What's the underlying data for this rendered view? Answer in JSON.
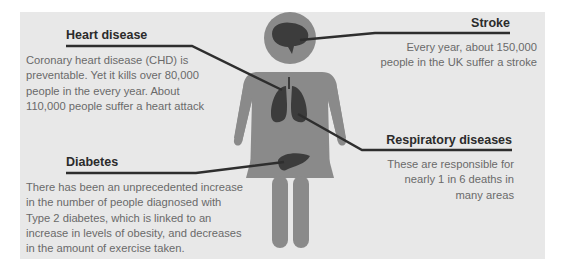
{
  "colors": {
    "panel": "#e8e8e8",
    "figure": "#8a8a8a",
    "organ": "#3c3c3c",
    "leader": "#2e2e2e",
    "title_text": "#2b2b2b",
    "body_text": "#6a6a6a"
  },
  "callouts": {
    "heart": {
      "title": "Heart disease",
      "lines": [
        "Coronary heart disease  (CHD) is",
        "preventable. Yet it kills over 80,000",
        "people in the every year. About",
        "110,000 people suffer a heart attack"
      ]
    },
    "stroke": {
      "title": "Stroke",
      "lines": [
        "Every year, about 150,000",
        "people in the UK suffer a stroke"
      ]
    },
    "respiratory": {
      "title": "Respiratory diseases",
      "lines": [
        "These are responsible for",
        "nearly 1 in 6 deaths in",
        "many areas"
      ]
    },
    "diabetes": {
      "title": "Diabetes",
      "lines": [
        "There has been an unprecedented increase",
        "in the number of people diagnosed with",
        "Type 2 diabetes, which is linked to an",
        "increase in levels of obesity, and decreases",
        "in the amount of exercise taken."
      ]
    }
  },
  "figure": {
    "organs": [
      "brain-icon",
      "lungs-icon",
      "liver-icon"
    ]
  }
}
